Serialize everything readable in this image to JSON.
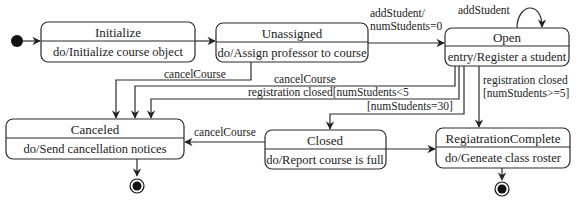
{
  "diagram": {
    "type": "uml-state-machine",
    "states": [
      {
        "id": "initialize",
        "name": "Initialize",
        "action": "do/Initialize course object"
      },
      {
        "id": "unassigned",
        "name": "Unassigned",
        "action": "do/Assign professor to course"
      },
      {
        "id": "open",
        "name": "Open",
        "action": "entry/Register a student"
      },
      {
        "id": "canceled",
        "name": "Canceled",
        "action": "do/Send cancellation notices"
      },
      {
        "id": "closed",
        "name": "Closed",
        "action": "do/Report course is full"
      },
      {
        "id": "registration_complete",
        "name": "RegiatrationComplete",
        "action": "do/Geneate class roster"
      }
    ],
    "transitions": [
      {
        "from": "initial",
        "to": "initialize",
        "label": ""
      },
      {
        "from": "initialize",
        "to": "unassigned",
        "label": ""
      },
      {
        "from": "unassigned",
        "to": "open",
        "label_line1": "addStudent/",
        "label_line2": "numStudents=0"
      },
      {
        "from": "open",
        "to": "open",
        "label": "addStudent"
      },
      {
        "from": "unassigned",
        "to": "canceled",
        "label": "cancelCourse"
      },
      {
        "from": "open",
        "to": "canceled",
        "label": "cancelCourse"
      },
      {
        "from": "open",
        "to": "canceled",
        "label": "registration closed[numStudents<5"
      },
      {
        "from": "open",
        "to": "closed",
        "label": "[numStudents=30]"
      },
      {
        "from": "open",
        "to": "registration_complete",
        "label_line1": "registration closed",
        "label_line2": "[numStudents>=5]"
      },
      {
        "from": "closed",
        "to": "canceled",
        "label": "cancelCourse"
      },
      {
        "from": "closed",
        "to": "registration_complete",
        "label": ""
      },
      {
        "from": "canceled",
        "to": "final",
        "label": ""
      },
      {
        "from": "registration_complete",
        "to": "final",
        "label": ""
      }
    ]
  }
}
